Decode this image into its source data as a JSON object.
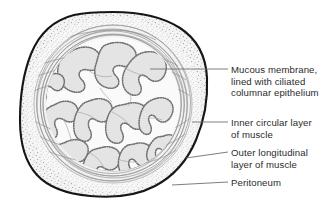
{
  "figure": {
    "kind": "anatomical-cross-section",
    "background_color": "#ffffff",
    "ink_color": "#1a1a1a",
    "leader_color": "#6f6f6f",
    "text_color": "#2b2b2b",
    "fill_light": "#f1f1f1",
    "fill_mid": "#e2e2e2",
    "fill_dark": "#d2d2d2"
  },
  "labels": [
    {
      "id": "mucosa",
      "text": "Mucous membrane,\nlined with ciliated\ncolumnar epithelium",
      "leader": {
        "x1": 150,
        "y1": 69,
        "x2": 228,
        "y2": 69
      }
    },
    {
      "id": "inner-muscle",
      "text": "Inner circular layer\nof muscle",
      "leader": {
        "x1": 192,
        "y1": 122,
        "x2": 228,
        "y2": 122
      }
    },
    {
      "id": "outer-muscle",
      "text": "Outer longitudinal\nlayer of muscle",
      "leader": {
        "x1": 186,
        "y1": 158,
        "x2": 228,
        "y2": 152
      }
    },
    {
      "id": "peritoneum",
      "text": "Peritoneum",
      "leader": {
        "x1": 172,
        "y1": 185,
        "x2": 228,
        "y2": 182
      }
    }
  ],
  "structures": {
    "outer_boundary": "irregular closed organ outline (serosa / peritoneum edge)",
    "peritoneum_band": "stippled outermost band",
    "outer_longitudinal_band": "stippled band just inside serosa",
    "inner_circular_band": "concentric wavy fibre lines",
    "mucosa": "branching labyrinthine folds with beaded ciliated epithelial border"
  }
}
